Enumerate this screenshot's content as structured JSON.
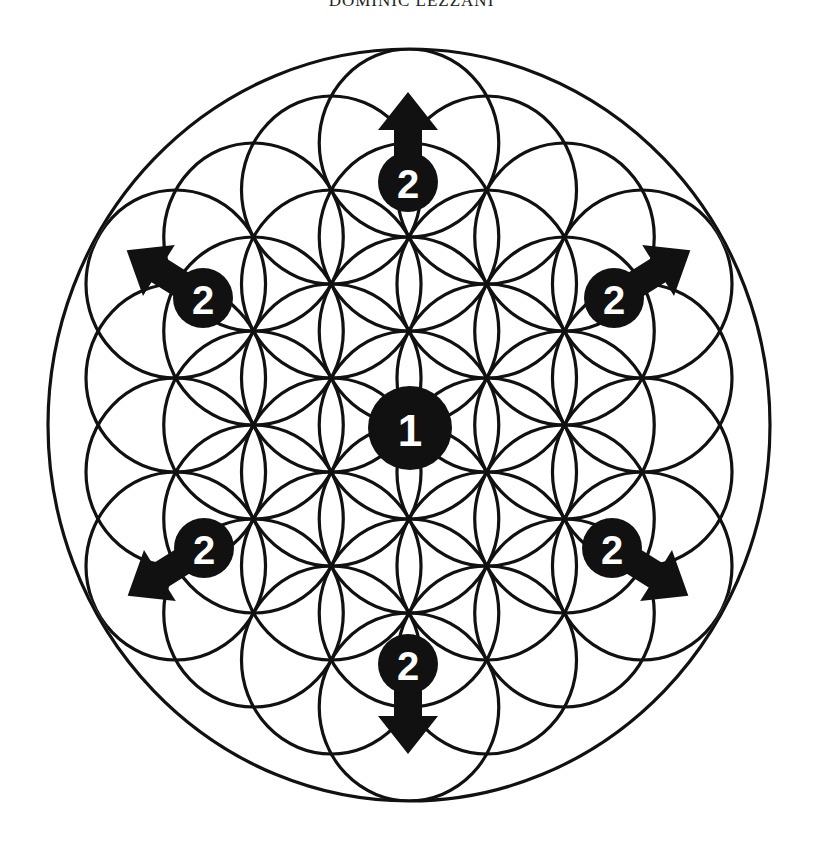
{
  "header": {
    "text": "DOMINIC LEZZANI"
  },
  "diagram": {
    "colors": {
      "line": "#111111",
      "badge": "#111111",
      "badge_text": "#ffffff",
      "background": "#ffffff"
    },
    "center_badge": {
      "label": "1"
    },
    "outer_badges": [
      {
        "label": "2",
        "direction": "up"
      },
      {
        "label": "2",
        "direction": "up-right"
      },
      {
        "label": "2",
        "direction": "down-right"
      },
      {
        "label": "2",
        "direction": "down"
      },
      {
        "label": "2",
        "direction": "down-left"
      },
      {
        "label": "2",
        "direction": "up-left"
      }
    ]
  }
}
